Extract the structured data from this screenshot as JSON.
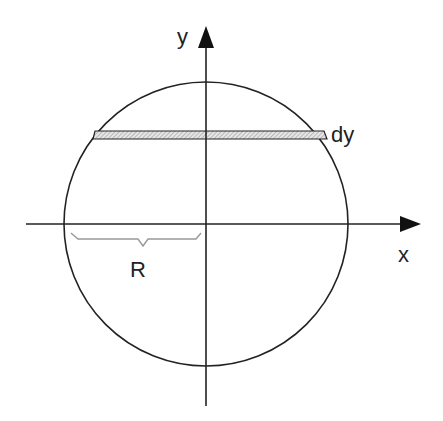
{
  "diagram": {
    "type": "circle-with-strip",
    "labels": {
      "y_axis": "y",
      "x_axis": "x",
      "strip": "dy",
      "radius": "R"
    },
    "colors": {
      "stroke": "#222222",
      "strip_fill": "#cfcfcf",
      "brace": "#999999"
    }
  }
}
